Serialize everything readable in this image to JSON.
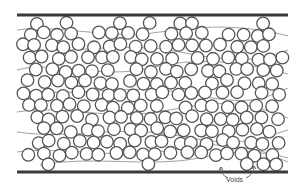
{
  "figure": {
    "width": 304,
    "height": 189,
    "plates": {
      "top": {
        "x1": 17,
        "x2": 288,
        "y": 15
      },
      "bottom": {
        "x1": 17,
        "x2": 288,
        "y": 172
      }
    },
    "fiber_radius": 6.3,
    "grid": {
      "x0": 22,
      "y0": 22,
      "dx": 14.2,
      "dy": 12.0,
      "rows": 13,
      "cols": 19
    },
    "waves": [
      "M17,30 C60,24 110,40 160,32 S250,26 288,36",
      "M17,48 C70,56 120,40 180,52 S260,60 288,50",
      "M17,70 C50,60 100,80 150,68 S240,62 288,74",
      "M17,90 C80,98 130,82 190,94 S260,100 288,88",
      "M17,112 C60,104 110,122 170,110 S250,104 288,118",
      "M17,132 C70,140 120,124 180,136 S255,140 288,130",
      "M17,152 C60,146 120,160 170,150 S240,146 288,158",
      "M40,165 C90,155 150,168 200,158 S260,150 288,162"
    ],
    "annotation": {
      "label": "Voids",
      "label_x": 226,
      "label_y": 176,
      "arrows": [
        {
          "path": "M228,178 C222,175 220,171 221,167",
          "tip_x": 221,
          "tip_y": 167
        },
        {
          "path": "M246,178 C252,175 254,171 254,166",
          "tip_x": 254,
          "tip_y": 166
        }
      ]
    }
  }
}
